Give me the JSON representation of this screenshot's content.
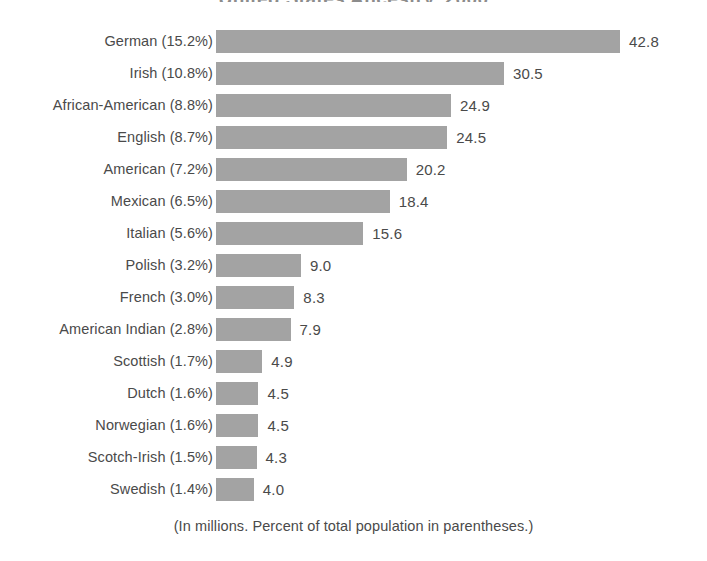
{
  "chart_data": {
    "type": "bar",
    "orientation": "horizontal",
    "title": "United States Ancestry, 2000",
    "footnote": "(In millions. Percent of total population in parentheses.)",
    "xlabel": "",
    "ylabel": "",
    "xlim": [
      0,
      42.8
    ],
    "grid": false,
    "legend": "none",
    "bar_color": "#a3a3a3",
    "text_color": "#4a4a4a",
    "categories": [
      "German",
      "Irish",
      "African-American",
      "English",
      "American",
      "Mexican",
      "Italian",
      "Polish",
      "French",
      "American Indian",
      "Scottish",
      "Dutch",
      "Norwegian",
      "Scotch-Irish",
      "Swedish"
    ],
    "values": [
      42.8,
      30.5,
      24.9,
      24.5,
      20.2,
      18.4,
      15.6,
      9.0,
      8.3,
      7.9,
      4.9,
      4.5,
      4.5,
      4.3,
      4.0
    ],
    "percent_of_population": [
      "15.2%",
      "10.8%",
      "8.8%",
      "8.7%",
      "7.2%",
      "6.5%",
      "5.6%",
      "3.2%",
      "3.0%",
      "2.8%",
      "1.7%",
      "1.6%",
      "1.6%",
      "1.5%",
      "1.4%"
    ],
    "rows": [
      {
        "label": "German (15.2%)",
        "value": 42.8,
        "value_label": "42.8"
      },
      {
        "label": "Irish (10.8%)",
        "value": 30.5,
        "value_label": "30.5"
      },
      {
        "label": "African-American (8.8%)",
        "value": 24.9,
        "value_label": "24.9"
      },
      {
        "label": "English (8.7%)",
        "value": 24.5,
        "value_label": "24.5"
      },
      {
        "label": "American (7.2%)",
        "value": 20.2,
        "value_label": "20.2"
      },
      {
        "label": "Mexican (6.5%)",
        "value": 18.4,
        "value_label": "18.4"
      },
      {
        "label": "Italian (5.6%)",
        "value": 15.6,
        "value_label": "15.6"
      },
      {
        "label": "Polish (3.2%)",
        "value": 9.0,
        "value_label": "9.0"
      },
      {
        "label": "French (3.0%)",
        "value": 8.3,
        "value_label": "8.3"
      },
      {
        "label": "American Indian (2.8%)",
        "value": 7.9,
        "value_label": "7.9"
      },
      {
        "label": "Scottish (1.7%)",
        "value": 4.9,
        "value_label": "4.9"
      },
      {
        "label": "Dutch (1.6%)",
        "value": 4.5,
        "value_label": "4.5"
      },
      {
        "label": "Norwegian (1.6%)",
        "value": 4.5,
        "value_label": "4.5"
      },
      {
        "label": "Scotch-Irish (1.5%)",
        "value": 4.3,
        "value_label": "4.3"
      },
      {
        "label": "Swedish (1.4%)",
        "value": 4.0,
        "value_label": "4.0"
      }
    ]
  }
}
